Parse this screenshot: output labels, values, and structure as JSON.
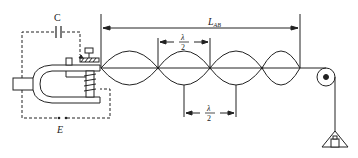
{
  "diagram": {
    "labels": {
      "capacitor": "C",
      "battery": "E",
      "length_main": "L",
      "length_sub": "AB",
      "half_wavelength_num": "λ",
      "half_wavelength_den": "2",
      "half_wavelength_num_2": "λ",
      "half_wavelength_den_2": "2"
    },
    "components": [
      "tuning-fork-vibrator",
      "electromagnet-coil",
      "capacitor",
      "battery",
      "string",
      "pulley",
      "hanging-weight"
    ],
    "string": {
      "start_x": 101,
      "end_x": 300,
      "y": 68,
      "loops": 4,
      "nodes_x": [
        101,
        158,
        210,
        262,
        300
      ]
    },
    "colors": {
      "line": "#222222",
      "background": "#ffffff"
    }
  }
}
